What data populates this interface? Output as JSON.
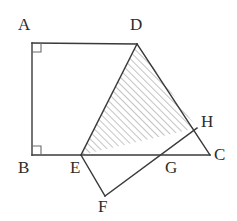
{
  "figure": {
    "stroke_color": "#3a3a3a",
    "hatch_color": "#8a8a8a",
    "label_color": "#2b2b2b",
    "background_color": "#ffffff",
    "stroke_width": 1.4,
    "hatch_spacing": 5,
    "hatch_angle_deg": 45
  },
  "vertices": [
    {
      "id": "A",
      "label": "A",
      "x": 32,
      "y": 43,
      "label_x": 18,
      "label_y": 16
    },
    {
      "id": "D",
      "label": "D",
      "x": 137,
      "y": 44,
      "label_x": 130,
      "label_y": 16
    },
    {
      "id": "B",
      "label": "B",
      "x": 32,
      "y": 155,
      "label_x": 18,
      "label_y": 159
    },
    {
      "id": "E",
      "label": "E",
      "x": 81,
      "y": 155,
      "label_x": 70,
      "label_y": 159
    },
    {
      "id": "G",
      "label": "G",
      "x": 172,
      "y": 155,
      "label_x": 165,
      "label_y": 159
    },
    {
      "id": "C",
      "label": "C",
      "x": 210,
      "y": 155,
      "label_x": 214,
      "label_y": 146
    },
    {
      "id": "H",
      "label": "H",
      "x": 197,
      "y": 128,
      "label_x": 201,
      "label_y": 113
    },
    {
      "id": "F",
      "label": "F",
      "x": 105,
      "y": 196,
      "label_x": 98,
      "label_y": 198
    }
  ],
  "segments": [
    {
      "name": "segment-AD",
      "from": "A",
      "to": "D"
    },
    {
      "name": "segment-AB",
      "from": "A",
      "to": "B"
    },
    {
      "name": "segment-BC",
      "from": "B",
      "to": "C"
    },
    {
      "name": "segment-DE",
      "from": "D",
      "to": "E"
    },
    {
      "name": "segment-DC",
      "from": "D",
      "to": "C"
    },
    {
      "name": "segment-EF",
      "from": "E",
      "to": "F"
    },
    {
      "name": "segment-FH",
      "from": "F",
      "to": "H"
    }
  ],
  "shaded_region": {
    "name": "shaded-triangle-DEH",
    "vertices": [
      "D",
      "E",
      "H"
    ],
    "fill": "hatched"
  },
  "right_angles": [
    {
      "name": "right-angle-A",
      "at": "A",
      "x": 32,
      "y": 43,
      "dx": 1,
      "dy": 1,
      "size": 9
    },
    {
      "name": "right-angle-B",
      "at": "B",
      "x": 32,
      "y": 155,
      "dx": 1,
      "dy": -1,
      "size": 9
    }
  ]
}
